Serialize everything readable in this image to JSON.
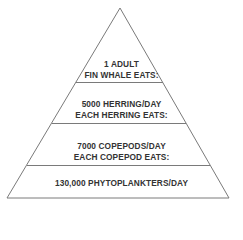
{
  "diagram": {
    "type": "food-pyramid",
    "line_color": "#7a7a7a",
    "text_color": "#333333",
    "tiers": [
      {
        "lines": [
          "1 ADULT",
          "FIN WHALE EATS:"
        ]
      },
      {
        "lines": [
          "5000 HERRING/DAY",
          "EACH HERRING EATS:"
        ]
      },
      {
        "lines": [
          "7000 COPEPODS/DAY",
          "EACH COPEPOD EATS:"
        ]
      },
      {
        "lines": [
          "130,000 PHYTOPLANKTERS/DAY"
        ]
      }
    ]
  }
}
